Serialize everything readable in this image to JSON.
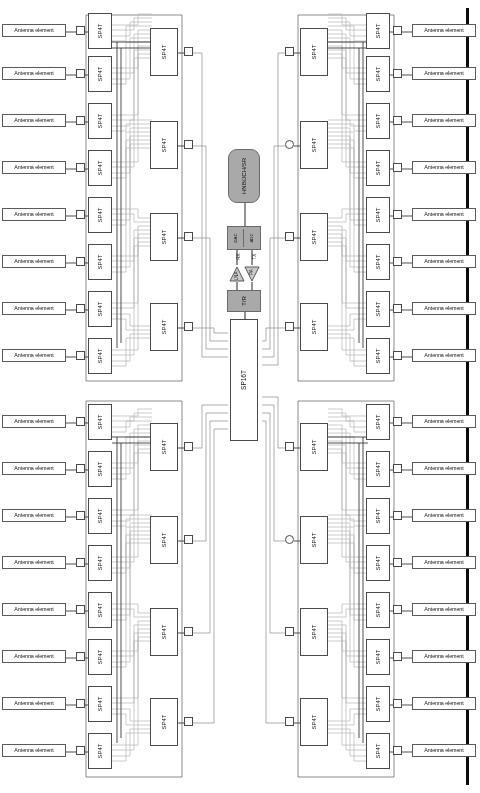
{
  "figure": {
    "orientation_degrees": 180,
    "labels": {
      "antenna_element": "Antenna element",
      "sp4t": "SP4T",
      "sp16t": "SP16T",
      "tr_switch": "T/R",
      "adc": "ADC",
      "dac": "DAC",
      "pa": "PA",
      "lna": "LNA",
      "tx_path": "TX",
      "rx_path": "RX",
      "baseband": "HNB/JCH/SR"
    },
    "colors": {
      "grey_block_fill": "#a9a9a9",
      "grey_block_stroke": "#6a6a6a",
      "box_stroke": "#4a4a4a",
      "wire_dark": "#3a3a3a",
      "wire_light": "#b9b9b9",
      "page_edge": "#0a0a0a",
      "background": "#ffffff"
    },
    "counts": {
      "quadrants": 4,
      "antenna_elements_per_quadrant": 8,
      "antenna_elements_total": 32,
      "sp4t_stage1_per_quadrant": 8,
      "sp4t_stage2_per_quadrant": 4,
      "sp4t_total": 48,
      "sp16t_total": 1
    },
    "quadrants": [
      {
        "id": "top-left",
        "side": "left",
        "antennas": [
          "Antenna element",
          "Antenna element",
          "Antenna element",
          "Antenna element",
          "Antenna element",
          "Antenna element",
          "Antenna element",
          "Antenna element"
        ],
        "sp4t_stage1": [
          "SP4T",
          "SP4T",
          "SP4T",
          "SP4T",
          "SP4T",
          "SP4T",
          "SP4T",
          "SP4T"
        ],
        "sp4t_stage2": [
          "SP4T",
          "SP4T",
          "SP4T",
          "SP4T"
        ]
      },
      {
        "id": "bottom-left",
        "side": "left",
        "antennas": [
          "Antenna element",
          "Antenna element",
          "Antenna element",
          "Antenna element",
          "Antenna element",
          "Antenna element",
          "Antenna element",
          "Antenna element"
        ],
        "sp4t_stage1": [
          "SP4T",
          "SP4T",
          "SP4T",
          "SP4T",
          "SP4T",
          "SP4T",
          "SP4T",
          "SP4T"
        ],
        "sp4t_stage2": [
          "SP4T",
          "SP4T",
          "SP4T",
          "SP4T"
        ]
      },
      {
        "id": "top-right",
        "side": "right",
        "antennas": [
          "Antenna element",
          "Antenna element",
          "Antenna element",
          "Antenna element",
          "Antenna element",
          "Antenna element",
          "Antenna element",
          "Antenna element"
        ],
        "sp4t_stage1": [
          "SP4T",
          "SP4T",
          "SP4T",
          "SP4T",
          "SP4T",
          "SP4T",
          "SP4T",
          "SP4T"
        ],
        "sp4t_stage2": [
          "SP4T",
          "SP4T",
          "SP4T",
          "SP4T"
        ]
      },
      {
        "id": "bottom-right",
        "side": "right",
        "antennas": [
          "Antenna element",
          "Antenna element",
          "Antenna element",
          "Antenna element",
          "Antenna element",
          "Antenna element",
          "Antenna element",
          "Antenna element"
        ],
        "sp4t_stage1": [
          "SP4T",
          "SP4T",
          "SP4T",
          "SP4T",
          "SP4T",
          "SP4T",
          "SP4T",
          "SP4T"
        ],
        "sp4t_stage2": [
          "SP4T",
          "SP4T",
          "SP4T",
          "SP4T"
        ]
      }
    ],
    "rf_chain": [
      "SP16T",
      "T/R",
      "PA",
      "LNA",
      "ADC",
      "DAC",
      "HNB/JCH/SR"
    ]
  }
}
